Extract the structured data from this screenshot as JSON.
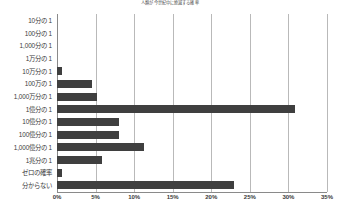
{
  "chart_data": {
    "type": "bar",
    "orientation": "horizontal",
    "title": "人類が今世紀中に絶滅する確率",
    "xlabel": "",
    "ylabel": "",
    "categories": [
      "10分の 1",
      "100分の 1",
      "1,000分の 1",
      "1万分の 1",
      "10万分の 1",
      "100万の 1",
      "1,000万分の 1",
      "1億分の 1",
      "10億分の 1",
      "100億分の 1",
      "1,000億分の 1",
      "1兆分の 1",
      "ゼロの確率",
      "分からない"
    ],
    "values": [
      0,
      0,
      0,
      0,
      0.6,
      4.6,
      5.2,
      30.9,
      8.0,
      8.0,
      11.3,
      5.8,
      0.6,
      23.0
    ],
    "xlim": [
      0,
      35
    ],
    "xtick_values": [
      0,
      5,
      10,
      15,
      20,
      25,
      30,
      35
    ],
    "xtick_labels": [
      "0%",
      "5%",
      "10%",
      "15%",
      "20%",
      "25%",
      "30%",
      "35%"
    ],
    "grid": true,
    "legend": false,
    "bar_color": "#3f3f3f",
    "grid_color": "#b9b9b9",
    "axis_color": "#8a8a8a"
  }
}
